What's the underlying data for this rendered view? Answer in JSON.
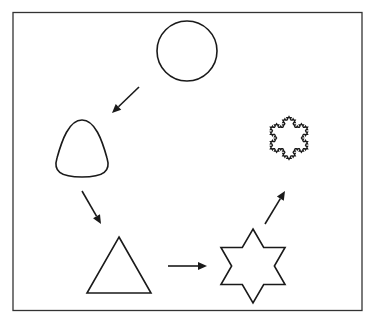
{
  "diagram": {
    "colors": {
      "stroke": "#1a1a1a",
      "frame": "#333333",
      "background": "#ffffff"
    },
    "shapes": [
      {
        "id": "circle",
        "label": "circle",
        "cx": 187,
        "cy": 51,
        "r": 30
      },
      {
        "id": "rounded-triangle",
        "label": "rounded triangle"
      },
      {
        "id": "triangle",
        "label": "triangle",
        "points": [
          [
            119,
            237
          ],
          [
            151,
            293
          ],
          [
            87,
            293
          ]
        ]
      },
      {
        "id": "hexagram",
        "label": "six-pointed star",
        "cx": 253,
        "cy": 266,
        "r_outer": 37
      },
      {
        "id": "koch-snowflake",
        "label": "Koch snowflake",
        "cx": 289,
        "cy": 138,
        "r_outer": 37,
        "iterations": 3
      }
    ],
    "arrows": [
      {
        "from": "circle",
        "to": "rounded-triangle",
        "x1": 139,
        "y1": 87,
        "x2": 112,
        "y2": 113
      },
      {
        "from": "rounded-triangle",
        "to": "triangle",
        "x1": 82,
        "y1": 191,
        "x2": 101,
        "y2": 224
      },
      {
        "from": "triangle",
        "to": "hexagram",
        "x1": 168,
        "y1": 266,
        "x2": 207,
        "y2": 266
      },
      {
        "from": "hexagram",
        "to": "koch-snowflake",
        "x1": 265,
        "y1": 224,
        "x2": 285,
        "y2": 191
      }
    ]
  }
}
